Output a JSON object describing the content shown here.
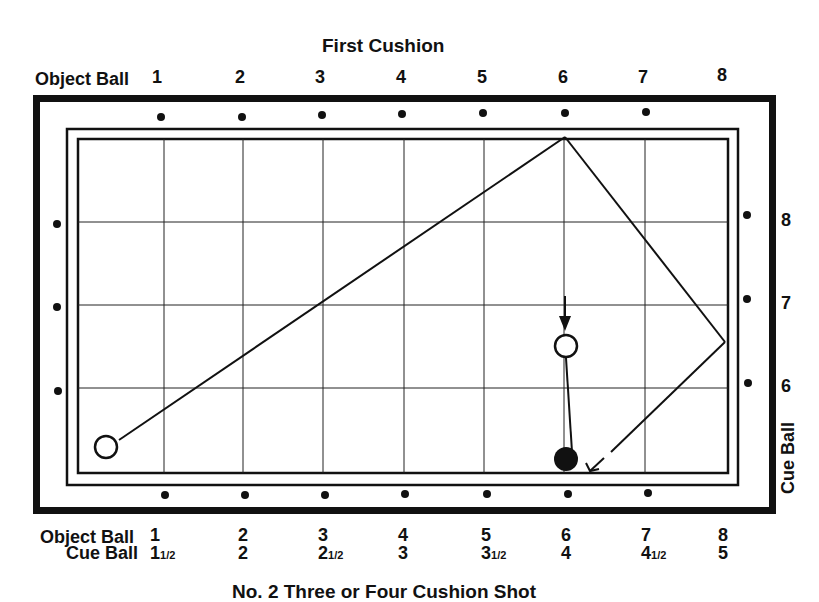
{
  "diagram": {
    "top_title": "First Cushion",
    "bottom_title": "No. 2 Three or Four Cushion Shot",
    "top_row": {
      "label": "Object Ball",
      "numbers": [
        "1",
        "2",
        "3",
        "4",
        "5",
        "6",
        "7",
        "8"
      ]
    },
    "right_column": {
      "label": "Cue Ball",
      "numbers": [
        "8",
        "7",
        "6"
      ]
    },
    "bottom_rows": {
      "object_ball": {
        "label": "Object Ball",
        "numbers": [
          "1",
          "2",
          "3",
          "4",
          "5",
          "6",
          "7",
          "8"
        ]
      },
      "cue_ball": {
        "label": "Cue Ball",
        "numbers": [
          {
            "whole": "1",
            "frac": "1/2"
          },
          {
            "whole": "2",
            "frac": ""
          },
          {
            "whole": "2",
            "frac": "1/2"
          },
          {
            "whole": "3",
            "frac": ""
          },
          {
            "whole": "3",
            "frac": "1/2"
          },
          {
            "whole": "4",
            "frac": ""
          },
          {
            "whole": "4",
            "frac": "1/2"
          },
          {
            "whole": "5",
            "frac": ""
          }
        ]
      }
    },
    "elements": {
      "cue_ball": "white ball lower-left",
      "object_ball_start": "white ball near diamond 6 with arrow",
      "object_ball_target": "black ball at bottom cushion",
      "path": "cue ball travels to top rail near diamond 6, then right rail, then dashed return to bottom rail"
    }
  }
}
